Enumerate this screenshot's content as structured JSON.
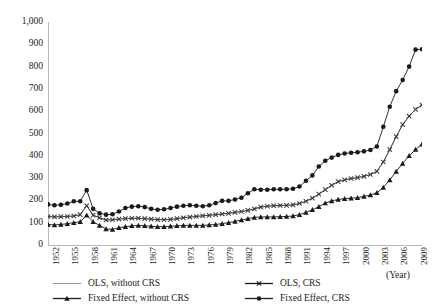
{
  "chart_data": {
    "type": "line",
    "title": "",
    "xlabel": "(Year)",
    "ylabel": "",
    "ylim": [
      0,
      1000
    ],
    "xlim": [
      1952,
      2010
    ],
    "grid": false,
    "legend_position": "bottom",
    "y_ticks": [
      "0",
      "100",
      "200",
      "300",
      "400",
      "500",
      "600",
      "700",
      "800",
      "900",
      "1,000"
    ],
    "y_tick_values": [
      0,
      100,
      200,
      300,
      400,
      500,
      600,
      700,
      800,
      900,
      1000
    ],
    "x_tick_labels": [
      "1952",
      "1955",
      "1958",
      "1961",
      "1964",
      "1967",
      "1970",
      "1973",
      "1976",
      "1979",
      "1982",
      "1985",
      "1988",
      "1991",
      "1994",
      "1997",
      "2000",
      "2003",
      "2006",
      "2009"
    ],
    "x_tick_values": [
      1952,
      1955,
      1958,
      1961,
      1964,
      1967,
      1970,
      1973,
      1976,
      1979,
      1982,
      1985,
      1988,
      1991,
      1994,
      1997,
      2000,
      2003,
      2006,
      2009
    ],
    "x": [
      1952,
      1953,
      1954,
      1955,
      1956,
      1957,
      1958,
      1959,
      1960,
      1961,
      1962,
      1963,
      1964,
      1965,
      1966,
      1967,
      1968,
      1969,
      1970,
      1971,
      1972,
      1973,
      1974,
      1975,
      1976,
      1977,
      1978,
      1979,
      1980,
      1981,
      1982,
      1983,
      1984,
      1985,
      1986,
      1987,
      1988,
      1989,
      1990,
      1991,
      1992,
      1993,
      1994,
      1995,
      1996,
      1997,
      1998,
      1999,
      2000,
      2001,
      2002,
      2003,
      2004,
      2005,
      2006,
      2007,
      2008,
      2009,
      2010
    ],
    "series": [
      {
        "name": "OLS, without CRS",
        "marker": "none",
        "color": "#9a9a9a",
        "values": [
          128,
          126,
          127,
          128,
          130,
          136,
          176,
          134,
          122,
          112,
          113,
          116,
          118,
          120,
          120,
          118,
          116,
          114,
          113,
          115,
          118,
          122,
          125,
          128,
          131,
          133,
          136,
          139,
          142,
          146,
          150,
          155,
          162,
          170,
          174,
          176,
          177,
          178,
          180,
          186,
          196,
          210,
          228,
          248,
          268,
          284,
          292,
          298,
          302,
          308,
          316,
          330,
          372,
          428,
          486,
          540,
          578,
          608,
          628
        ]
      },
      {
        "name": "OLS, CRS",
        "marker": "cross",
        "color": "#3a3a3a",
        "values": [
          128,
          126,
          127,
          128,
          130,
          136,
          176,
          134,
          122,
          112,
          113,
          116,
          118,
          120,
          120,
          118,
          116,
          114,
          113,
          115,
          118,
          122,
          125,
          128,
          131,
          133,
          136,
          139,
          142,
          146,
          150,
          155,
          162,
          170,
          174,
          176,
          177,
          178,
          180,
          186,
          196,
          210,
          228,
          248,
          268,
          284,
          292,
          298,
          302,
          308,
          316,
          330,
          372,
          428,
          486,
          540,
          578,
          608,
          628
        ]
      },
      {
        "name": "Fixed Effect, without CRS",
        "marker": "triangle",
        "color": "#1a1a1a",
        "values": [
          92,
          90,
          92,
          96,
          100,
          104,
          134,
          104,
          88,
          72,
          70,
          78,
          82,
          86,
          88,
          86,
          84,
          82,
          82,
          84,
          86,
          88,
          88,
          88,
          88,
          90,
          92,
          96,
          100,
          106,
          112,
          118,
          124,
          126,
          126,
          126,
          127,
          128,
          130,
          136,
          146,
          158,
          172,
          188,
          198,
          204,
          208,
          210,
          212,
          218,
          224,
          234,
          258,
          292,
          330,
          366,
          400,
          428,
          452
        ]
      },
      {
        "name": "Fixed Effect, CRS",
        "marker": "circle",
        "color": "#1a1a1a",
        "values": [
          182,
          178,
          180,
          186,
          196,
          196,
          246,
          162,
          142,
          136,
          138,
          150,
          166,
          172,
          174,
          170,
          162,
          158,
          160,
          166,
          172,
          176,
          178,
          176,
          174,
          178,
          188,
          198,
          198,
          204,
          212,
          232,
          250,
          248,
          248,
          250,
          250,
          250,
          252,
          262,
          288,
          312,
          352,
          378,
          392,
          404,
          410,
          414,
          416,
          420,
          426,
          442,
          530,
          620,
          690,
          740,
          800,
          876,
          878
        ]
      }
    ]
  },
  "legend": {
    "items": [
      {
        "label": "OLS, without CRS",
        "marker": "none"
      },
      {
        "label": "OLS, CRS",
        "marker": "cross"
      },
      {
        "label": "Fixed Effect, without CRS",
        "marker": "triangle"
      },
      {
        "label": "Fixed Effect, CRS",
        "marker": "circle"
      }
    ]
  },
  "colors": {
    "axis": "#b8b8b8",
    "text": "#1a1a1a",
    "series_light": "#9a9a9a",
    "series_dark": "#1a1a1a"
  }
}
